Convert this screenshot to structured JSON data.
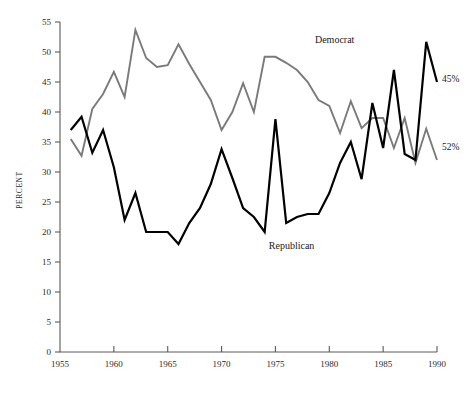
{
  "chart_data": {
    "type": "line",
    "title": "",
    "subtitle": "",
    "xlabel": "",
    "ylabel": "PERCENT",
    "xlim": [
      1955,
      1990
    ],
    "ylim": [
      0,
      55
    ],
    "grid": false,
    "legend_position": "inline-annotation",
    "xticks": [
      1955,
      1960,
      1965,
      1970,
      1975,
      1980,
      1985,
      1990
    ],
    "xtick_labels": [
      "1955",
      "1960",
      "1965",
      "1970",
      "1975",
      "1980",
      "1985",
      "1990"
    ],
    "yticks": [
      0,
      5,
      10,
      15,
      20,
      25,
      30,
      35,
      40,
      45,
      50,
      55
    ],
    "ytick_labels": [
      "0",
      "5",
      "10",
      "15",
      "20",
      "25",
      "30",
      "35",
      "40",
      "45",
      "50",
      "55"
    ],
    "series": [
      {
        "name": "Democrat",
        "color": "#7a7a78",
        "label_annotation": "Democrat",
        "end_label": "52%",
        "x": [
          1956,
          1957,
          1958,
          1959,
          1960,
          1961,
          1962,
          1963,
          1964,
          1965,
          1966,
          1967,
          1968,
          1969,
          1970,
          1971,
          1972,
          1973,
          1974,
          1975,
          1976,
          1977,
          1978,
          1979,
          1980,
          1981,
          1982,
          1983,
          1984,
          1985,
          1986,
          1987,
          1988,
          1989,
          1990
        ],
        "values": [
          35.5,
          32.7,
          40.5,
          43.0,
          46.7,
          42.5,
          53.7,
          49.0,
          47.5,
          47.8,
          51.3,
          48.0,
          45.0,
          42.0,
          37.0,
          40.0,
          44.8,
          40.0,
          49.2,
          49.2,
          48.2,
          47.0,
          45.0,
          42.0,
          41.0,
          36.5,
          41.8,
          37.3,
          39.0,
          39.0,
          34.0,
          39.0,
          31.5,
          37.2,
          32.0
        ]
      },
      {
        "name": "Republican",
        "color": "#000000",
        "label_annotation": "Republican",
        "end_label": "45%",
        "x": [
          1956,
          1957,
          1958,
          1959,
          1960,
          1961,
          1962,
          1963,
          1964,
          1965,
          1966,
          1967,
          1968,
          1969,
          1970,
          1971,
          1972,
          1973,
          1974,
          1975,
          1976,
          1977,
          1978,
          1979,
          1980,
          1981,
          1982,
          1983,
          1984,
          1985,
          1986,
          1987,
          1988,
          1989,
          1990
        ],
        "values": [
          37.0,
          39.2,
          33.2,
          37.0,
          30.8,
          22.0,
          26.5,
          20.0,
          20.0,
          20.0,
          18.0,
          21.5,
          24.0,
          28.0,
          33.8,
          29.0,
          24.0,
          22.5,
          20.0,
          38.8,
          21.5,
          22.5,
          23.0,
          23.0,
          26.5,
          31.5,
          35.0,
          28.8,
          41.5,
          34.0,
          47.0,
          33.0,
          32.0,
          51.7,
          45.0
        ]
      }
    ],
    "annotations": [
      {
        "text": "Democrat",
        "x": 1980.5,
        "y": 51.5
      },
      {
        "text": "Republican",
        "x": 1976.5,
        "y": 17.2
      },
      {
        "text": "45%",
        "x": 1991.0,
        "y": 45.0
      },
      {
        "text": "52%",
        "x": 1991.0,
        "y": 33.6
      }
    ]
  },
  "colors": {
    "democrat": "#7a7a78",
    "republican": "#000000",
    "axis": "#5a5a58",
    "background": "#ffffff",
    "text": "#1a1a1a"
  }
}
